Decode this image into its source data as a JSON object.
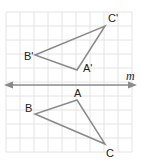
{
  "figure": {
    "type": "reflection-diagram",
    "line_label": "m",
    "colors": {
      "grid": "#e4e4e4",
      "shape": "#8a8a8a",
      "line": "#8a8a8a",
      "text": "#222222"
    },
    "grid": {
      "x0": 6,
      "y0": 12,
      "cols": 9,
      "rows": 10,
      "cell": 14
    },
    "line_m": {
      "y": 85,
      "x1": 4,
      "x2": 137
    },
    "image_triangle": {
      "labels": {
        "A": "A'",
        "B": "B'",
        "C": "C'"
      },
      "A": [
        77,
        70
      ],
      "B": [
        35,
        55
      ],
      "C": [
        105,
        26
      ]
    },
    "original_triangle": {
      "labels": {
        "A": "A",
        "B": "B",
        "C": "C"
      },
      "A": [
        77,
        100
      ],
      "B": [
        35,
        114
      ],
      "C": [
        105,
        144
      ]
    }
  }
}
